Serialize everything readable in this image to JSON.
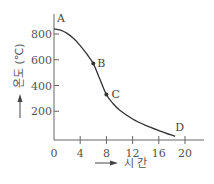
{
  "chart_data": {
    "type": "line",
    "title": "",
    "xlabel": "시 간",
    "ylabel": "온도 (℃)",
    "xlim": [
      0,
      22
    ],
    "ylim": [
      0,
      880
    ],
    "x_ticks": [
      0,
      4,
      8,
      12,
      16,
      20
    ],
    "x_tick_labels": [
      "0",
      "4",
      "8",
      "12",
      "16",
      "20"
    ],
    "y_ticks": [
      200,
      400,
      600,
      800
    ],
    "y_tick_labels": [
      "200",
      "400",
      "600",
      "800"
    ],
    "grid": false,
    "series": [
      {
        "name": "temperature",
        "x": [
          0,
          1,
          2,
          3,
          4,
          5,
          6,
          7,
          8,
          9,
          10,
          12,
          14,
          16,
          18.5
        ],
        "y": [
          840,
          830,
          805,
          765,
          710,
          645,
          570,
          450,
          330,
          260,
          210,
          140,
          90,
          50,
          5
        ]
      }
    ],
    "annotations": [
      {
        "label": "A",
        "x": 0,
        "y": 840,
        "marker": false
      },
      {
        "label": "B",
        "x": 6,
        "y": 570,
        "marker": true
      },
      {
        "label": "C",
        "x": 8,
        "y": 330,
        "marker": true
      },
      {
        "label": "D",
        "x": 18.5,
        "y": 5,
        "marker": false
      }
    ],
    "color": "#333333"
  }
}
